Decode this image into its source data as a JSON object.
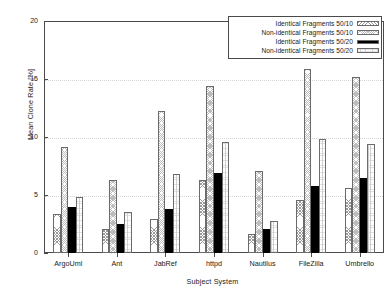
{
  "chart_data": {
    "type": "bar",
    "title": "",
    "xlabel": "Subject System",
    "ylabel": "Mean Clone Rate [%]",
    "ylim": [
      0,
      20
    ],
    "yticks": [
      0,
      5,
      10,
      15,
      20
    ],
    "grid": true,
    "legend_position": "top-right",
    "categories": [
      "ArgoUml",
      "Ant",
      "JabRef",
      "httpd",
      "Nautilus",
      "FileZilla",
      "Umbrello"
    ],
    "series": [
      {
        "name": "Identical Fragments 50/10",
        "pattern": "cross-hatch",
        "values": [
          3.4,
          2.1,
          2.9,
          6.3,
          1.6,
          4.6,
          5.6
        ]
      },
      {
        "name": "Non-identical Fragments 50/10",
        "pattern": "dense-cross-hatch",
        "values": [
          9.1,
          6.3,
          12.2,
          14.4,
          7.1,
          15.9,
          15.2
        ]
      },
      {
        "name": "Identical Fragments 50/20",
        "pattern": "solid-black",
        "values": [
          4.0,
          2.5,
          3.8,
          6.9,
          2.1,
          5.8,
          6.5
        ]
      },
      {
        "name": "Non-identical Fragments 50/20",
        "pattern": "light-vertical-hatch",
        "values": [
          4.8,
          3.5,
          6.8,
          9.6,
          2.8,
          9.8,
          9.4
        ]
      }
    ]
  },
  "legend": {
    "items": [
      {
        "label": "Identical Fragments 50/10"
      },
      {
        "label": "Non-identical Fragments 50/10"
      },
      {
        "label": "Identical Fragments 50/20"
      },
      {
        "label": "Non-identical Fragments 50/20"
      }
    ]
  },
  "axes": {
    "y_tick_labels": [
      "0",
      "5",
      "10",
      "15",
      "20"
    ],
    "x_tick_labels": [
      "ArgoUml",
      "Ant",
      "JabRef",
      "httpd",
      "Nautilus",
      "FileZilla",
      "Umbrello"
    ]
  },
  "colors": {
    "axis": "#4a4a4a",
    "grid": "#d6d6d6",
    "series_solid": "#000000",
    "background": "#ffffff"
  }
}
